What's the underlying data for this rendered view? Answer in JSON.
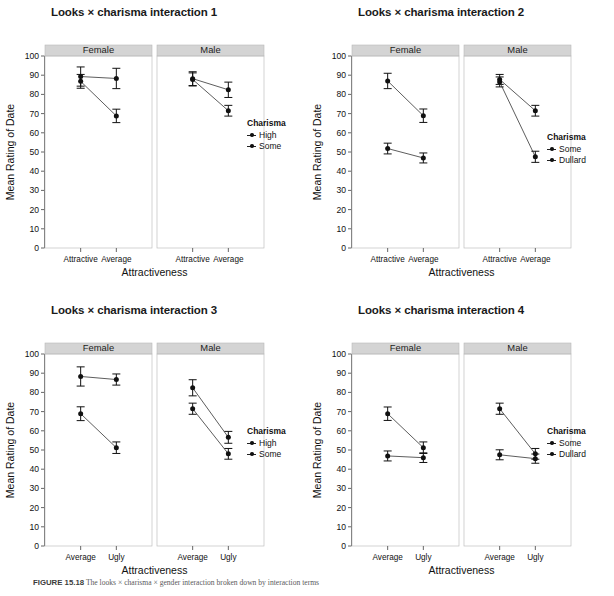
{
  "figure": {
    "caption_label": "FIGURE 15.18",
    "caption_text": "The looks × charisma × gender interaction broken down by interaction terms"
  },
  "axis": {
    "ylabel": "Mean Rating of Date",
    "xlabel": "Attractiveness",
    "yticks": [
      "0",
      "10",
      "20",
      "30",
      "40",
      "50",
      "60",
      "70",
      "80",
      "90",
      "100"
    ],
    "ylim": [
      0,
      100
    ],
    "panel_strips": [
      "Female",
      "Male"
    ],
    "legend_title": "Charisma"
  },
  "charts": [
    {
      "title": "Looks × charisma interaction 1",
      "legend_title": "Charisma",
      "legend_entries": [
        "High",
        "Some"
      ],
      "xlabel": "Attractiveness",
      "ylabel": "Mean Rating of Date",
      "categories": [
        "Attractive",
        "Average"
      ],
      "panels": [
        "Female",
        "Male"
      ]
    },
    {
      "title": "Looks × charisma interaction 2",
      "legend_title": "Charisma",
      "legend_entries": [
        "Some",
        "Dullard"
      ],
      "xlabel": "Attractiveness",
      "ylabel": "Mean Rating of Date",
      "categories": [
        "Attractive",
        "Average"
      ],
      "panels": [
        "Female",
        "Male"
      ]
    },
    {
      "title": "Looks × charisma interaction 3",
      "legend_title": "Charisma",
      "legend_entries": [
        "High",
        "Some"
      ],
      "xlabel": "Attractiveness",
      "ylabel": "Mean Rating of Date",
      "categories": [
        "Average",
        "Ugly"
      ],
      "panels": [
        "Female",
        "Male"
      ]
    },
    {
      "title": "Looks × charisma interaction 4",
      "legend_title": "Charisma",
      "legend_entries": [
        "Some",
        "Dullard"
      ],
      "xlabel": "Attractiveness",
      "ylabel": "Mean Rating of Date",
      "categories": [
        "Average",
        "Ugly"
      ],
      "panels": [
        "Female",
        "Male"
      ]
    }
  ],
  "chart_data": [
    {
      "type": "line",
      "title": "Looks × charisma interaction 1",
      "xlabel": "Attractiveness",
      "ylabel": "Mean Rating of Date",
      "ylim": [
        0,
        100
      ],
      "yticks": [
        0,
        10,
        20,
        30,
        40,
        50,
        60,
        70,
        80,
        90,
        100
      ],
      "grid": false,
      "legend_position": "right",
      "legend_title": "Charisma",
      "facets": [
        {
          "name": "Female",
          "categories": [
            "Attractive",
            "Average"
          ],
          "series": [
            {
              "name": "High",
              "values": [
                89.3,
                88.3
              ],
              "err": [
                5.0,
                5.3
              ]
            },
            {
              "name": "Some",
              "values": [
                86.8,
                68.8
              ],
              "err": [
                3.6,
                3.5
              ]
            }
          ]
        },
        {
          "name": "Male",
          "categories": [
            "Attractive",
            "Average"
          ],
          "series": [
            {
              "name": "High",
              "values": [
                88.2,
                82.4
              ],
              "err": [
                3.6,
                4.0
              ]
            },
            {
              "name": "Some",
              "values": [
                87.8,
                71.5
              ],
              "err": [
                3.4,
                2.8
              ]
            }
          ]
        }
      ]
    },
    {
      "type": "line",
      "title": "Looks × charisma interaction 2",
      "xlabel": "Attractiveness",
      "ylabel": "Mean Rating of Date",
      "ylim": [
        0,
        100
      ],
      "yticks": [
        0,
        10,
        20,
        30,
        40,
        50,
        60,
        70,
        80,
        90,
        100
      ],
      "grid": false,
      "legend_position": "right",
      "legend_title": "Charisma",
      "facets": [
        {
          "name": "Female",
          "categories": [
            "Attractive",
            "Average"
          ],
          "series": [
            {
              "name": "Some",
              "values": [
                87.0,
                68.9
              ],
              "err": [
                4.0,
                3.5
              ]
            },
            {
              "name": "Dullard",
              "values": [
                51.8,
                46.9
              ],
              "err": [
                2.8,
                2.6
              ]
            }
          ]
        },
        {
          "name": "Male",
          "categories": [
            "Attractive",
            "Average"
          ],
          "series": [
            {
              "name": "Some",
              "values": [
                87.8,
                71.5
              ],
              "err": [
                2.6,
                2.8
              ]
            },
            {
              "name": "Dullard",
              "values": [
                86.5,
                47.5
              ],
              "err": [
                2.6,
                2.9
              ]
            }
          ]
        }
      ]
    },
    {
      "type": "line",
      "title": "Looks × charisma interaction 3",
      "xlabel": "Attractiveness",
      "ylabel": "Mean Rating of Date",
      "ylim": [
        0,
        100
      ],
      "yticks": [
        0,
        10,
        20,
        30,
        40,
        50,
        60,
        70,
        80,
        90,
        100
      ],
      "grid": false,
      "legend_position": "right",
      "legend_title": "Charisma",
      "facets": [
        {
          "name": "Female",
          "categories": [
            "Average",
            "Ugly"
          ],
          "series": [
            {
              "name": "High",
              "values": [
                88.3,
                86.7
              ],
              "err": [
                5.0,
                2.9
              ]
            },
            {
              "name": "Some",
              "values": [
                68.9,
                51.2
              ],
              "err": [
                3.6,
                3.0
              ]
            }
          ]
        },
        {
          "name": "Male",
          "categories": [
            "Average",
            "Ugly"
          ],
          "series": [
            {
              "name": "High",
              "values": [
                82.4,
                56.6
              ],
              "err": [
                4.2,
                3.1
              ]
            },
            {
              "name": "Some",
              "values": [
                71.5,
                48.0
              ],
              "err": [
                2.9,
                2.8
              ]
            }
          ]
        }
      ]
    },
    {
      "type": "line",
      "title": "Looks × charisma interaction 4",
      "xlabel": "Attractiveness",
      "ylabel": "Mean Rating of Date",
      "ylim": [
        0,
        100
      ],
      "yticks": [
        0,
        10,
        20,
        30,
        40,
        50,
        60,
        70,
        80,
        90,
        100
      ],
      "grid": false,
      "legend_position": "right",
      "legend_title": "Charisma",
      "facets": [
        {
          "name": "Female",
          "categories": [
            "Average",
            "Ugly"
          ],
          "series": [
            {
              "name": "Some",
              "values": [
                68.9,
                51.2
              ],
              "err": [
                3.5,
                3.0
              ]
            },
            {
              "name": "Dullard",
              "values": [
                46.9,
                46.0
              ],
              "err": [
                2.6,
                2.5
              ]
            }
          ]
        },
        {
          "name": "Male",
          "categories": [
            "Average",
            "Ugly"
          ],
          "series": [
            {
              "name": "Some",
              "values": [
                71.5,
                48.0
              ],
              "err": [
                2.9,
                2.8
              ]
            },
            {
              "name": "Dullard",
              "values": [
                47.5,
                45.5
              ],
              "err": [
                2.6,
                2.4
              ]
            }
          ]
        }
      ]
    }
  ],
  "colors": {
    "strip_fill": "#d4d4d4",
    "line": "#333333",
    "point": "#111111",
    "axis": "#555555",
    "text": "#111111"
  }
}
